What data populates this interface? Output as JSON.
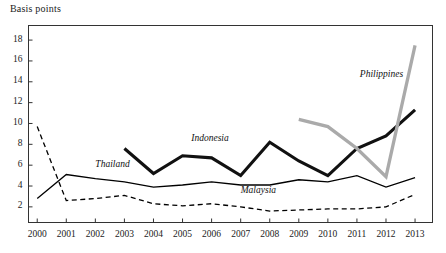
{
  "chart_data": {
    "type": "line",
    "title": "Basis points",
    "xlabel": "",
    "ylabel": "Basis points",
    "grid": false,
    "legend_position": "inline-labels",
    "x": [
      2000,
      2001,
      2002,
      2003,
      2004,
      2005,
      2006,
      2007,
      2008,
      2009,
      2010,
      2011,
      2012,
      2013
    ],
    "xlim": [
      1999.7,
      2013.6
    ],
    "ylim": [
      0.5,
      19.4
    ],
    "yticks": [
      2,
      4,
      6,
      8,
      10,
      12,
      14,
      16,
      18
    ],
    "xticks": [
      "2000",
      "2001",
      "2002",
      "2003",
      "2004",
      "2005",
      "2006",
      "2007",
      "2008",
      "2009",
      "2010",
      "2011",
      "2012",
      "2013"
    ],
    "series": [
      {
        "name": "Malaysia",
        "style": "dashed",
        "color": "#000000",
        "width": 1.3,
        "x": [
          2000,
          2001,
          2002,
          2003,
          2004,
          2005,
          2006,
          2007,
          2008,
          2009,
          2010,
          2011,
          2012,
          2013
        ],
        "values": [
          9.7,
          2.6,
          2.8,
          3.1,
          2.3,
          2.1,
          2.3,
          2.0,
          1.6,
          1.7,
          1.8,
          1.8,
          2.0,
          3.2
        ],
        "label_x": 2007.0,
        "label_y": 3.4
      },
      {
        "name": "Thailand",
        "style": "solid",
        "color": "#000000",
        "width": 1.3,
        "x": [
          2000,
          2001,
          2002,
          2003,
          2004,
          2005,
          2006,
          2007,
          2008,
          2009,
          2010,
          2011,
          2012,
          2013
        ],
        "values": [
          2.8,
          5.1,
          4.7,
          4.4,
          3.9,
          4.1,
          4.4,
          4.1,
          4.1,
          4.6,
          4.4,
          5.0,
          3.9,
          4.8
        ],
        "label_x": 2002.0,
        "label_y": 5.9
      },
      {
        "name": "Indonesia",
        "style": "solid",
        "color": "#111111",
        "width": 3.1,
        "x": [
          2003,
          2004,
          2005,
          2006,
          2007,
          2008,
          2009,
          2010,
          2011,
          2012,
          2013
        ],
        "values": [
          7.6,
          5.2,
          6.9,
          6.7,
          5.0,
          8.2,
          6.4,
          5.0,
          7.6,
          8.8,
          11.3
        ],
        "label_x": 2005.3,
        "label_y": 8.4
      },
      {
        "name": "Philippines",
        "style": "solid",
        "color": "#aaaaaa",
        "width": 3.3,
        "x": [
          2009,
          2010,
          2011,
          2012,
          2013
        ],
        "values": [
          10.4,
          9.7,
          7.6,
          4.9,
          17.5
        ],
        "label_x": 2011.1,
        "label_y": 14.6
      }
    ]
  },
  "axis": {
    "title": "Basis points"
  }
}
